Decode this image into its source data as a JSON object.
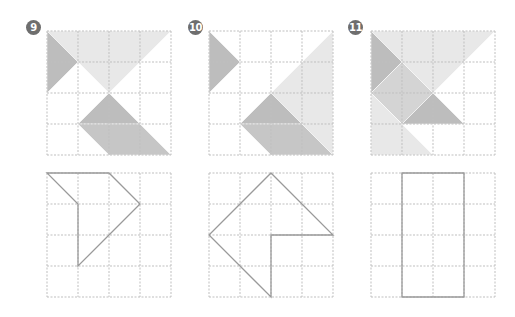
{
  "grid": {
    "cells": 4,
    "cell_size": 31,
    "line_color": "#bfbfbf",
    "outline_color": "#9a9a9a"
  },
  "colors": {
    "light": "#e8e8e8",
    "medium": "#d4d4d4",
    "dark": "#bdbdbd",
    "mid_dark": "#c6c6c6"
  },
  "puzzles": [
    {
      "number": "9",
      "badge": {
        "x": 26,
        "y": 20
      },
      "top": {
        "x": 47,
        "y": 31
      },
      "bottom": {
        "x": 47,
        "y": 173
      },
      "pieces": [
        {
          "points": [
            [
              0,
              0
            ],
            [
              4,
              0
            ],
            [
              2,
              2
            ]
          ],
          "fill": "light"
        },
        {
          "points": [
            [
              0,
              0
            ],
            [
              1,
              1
            ],
            [
              0,
              2
            ]
          ],
          "fill": "dark"
        },
        {
          "points": [
            [
              2,
              2
            ],
            [
              3,
              3
            ],
            [
              1,
              3
            ]
          ],
          "fill": "dark"
        },
        {
          "points": [
            [
              1,
              3
            ],
            [
              3,
              3
            ],
            [
              4,
              4
            ],
            [
              2,
              4
            ]
          ],
          "fill": "mid_dark"
        }
      ],
      "outline": [
        [
          0,
          0
        ],
        [
          2,
          0
        ],
        [
          3,
          1
        ],
        [
          1,
          3
        ],
        [
          1,
          1
        ]
      ]
    },
    {
      "number": "10",
      "badge": {
        "x": 188,
        "y": 20
      },
      "top": {
        "x": 209,
        "y": 31
      },
      "bottom": {
        "x": 209,
        "y": 173
      },
      "pieces": [
        {
          "points": [
            [
              0,
              0
            ],
            [
              1,
              1
            ],
            [
              0,
              2
            ]
          ],
          "fill": "dark"
        },
        {
          "points": [
            [
              4,
              0
            ],
            [
              4,
              4
            ],
            [
              2,
              2
            ]
          ],
          "fill": "light"
        },
        {
          "points": [
            [
              2,
              2
            ],
            [
              3,
              3
            ],
            [
              1,
              3
            ]
          ],
          "fill": "dark"
        },
        {
          "points": [
            [
              1,
              3
            ],
            [
              3,
              3
            ],
            [
              4,
              4
            ],
            [
              2,
              4
            ]
          ],
          "fill": "mid_dark"
        }
      ],
      "outline": [
        [
          2,
          0
        ],
        [
          4,
          2
        ],
        [
          2,
          2
        ],
        [
          2,
          4
        ],
        [
          0,
          2
        ]
      ]
    },
    {
      "number": "11",
      "badge": {
        "x": 348,
        "y": 20
      },
      "top": {
        "x": 371,
        "y": 31
      },
      "bottom": {
        "x": 371,
        "y": 173
      },
      "pieces": [
        {
          "points": [
            [
              0,
              0
            ],
            [
              4,
              0
            ],
            [
              2,
              2
            ]
          ],
          "fill": "light"
        },
        {
          "points": [
            [
              0,
              0
            ],
            [
              1,
              1
            ],
            [
              0,
              2
            ]
          ],
          "fill": "dark"
        },
        {
          "points": [
            [
              1,
              1
            ],
            [
              2,
              2
            ],
            [
              1,
              3
            ],
            [
              0,
              2
            ]
          ],
          "fill": "medium"
        },
        {
          "points": [
            [
              2,
              2
            ],
            [
              3,
              3
            ],
            [
              1,
              3
            ]
          ],
          "fill": "dark"
        },
        {
          "points": [
            [
              0,
              2
            ],
            [
              1,
              3
            ],
            [
              2,
              4
            ],
            [
              0,
              4
            ]
          ],
          "fill": "light"
        }
      ],
      "outline": [
        [
          1,
          0
        ],
        [
          3,
          0
        ],
        [
          3,
          4
        ],
        [
          1,
          4
        ]
      ]
    }
  ]
}
